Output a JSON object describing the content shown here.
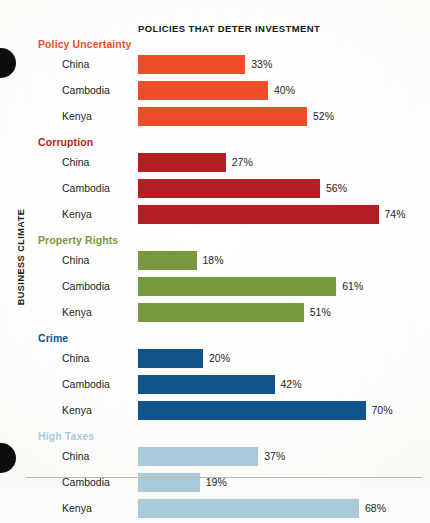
{
  "chart_title": "POLICIES THAT DETER INVESTMENT",
  "axis_label": "BUSINESS CLIMATE",
  "chart_data": {
    "type": "bar",
    "orientation": "horizontal",
    "title": "POLICIES THAT DETER INVESTMENT",
    "xlabel": "",
    "ylabel": "BUSINESS CLIMATE",
    "xlim": [
      0,
      80
    ],
    "grid": false,
    "legend": "none",
    "value_suffix": "%",
    "categories": [
      "China",
      "Cambodia",
      "Kenya"
    ],
    "groups": [
      {
        "name": "Policy Uncertainty",
        "color": "#F04E2A",
        "bars": [
          {
            "category": "China",
            "value": 33,
            "label": "33%"
          },
          {
            "category": "Cambodia",
            "value": 40,
            "label": "40%"
          },
          {
            "category": "Kenya",
            "value": 52,
            "label": "52%"
          }
        ]
      },
      {
        "name": "Corruption",
        "color": "#B51E24",
        "bars": [
          {
            "category": "China",
            "value": 27,
            "label": "27%"
          },
          {
            "category": "Cambodia",
            "value": 56,
            "label": "56%"
          },
          {
            "category": "Kenya",
            "value": 74,
            "label": "74%"
          }
        ]
      },
      {
        "name": "Property Rights",
        "color": "#79993F",
        "bars": [
          {
            "category": "China",
            "value": 18,
            "label": "18%"
          },
          {
            "category": "Cambodia",
            "value": 61,
            "label": "61%"
          },
          {
            "category": "Kenya",
            "value": 51,
            "label": "51%"
          }
        ]
      },
      {
        "name": "Crime",
        "color": "#11548C",
        "bars": [
          {
            "category": "China",
            "value": 20,
            "label": "20%"
          },
          {
            "category": "Cambodia",
            "value": 42,
            "label": "42%"
          },
          {
            "category": "Kenya",
            "value": 70,
            "label": "70%"
          }
        ]
      },
      {
        "name": "High Taxes",
        "color": "#A9CBD9",
        "bars": [
          {
            "category": "China",
            "value": 37,
            "label": "37%"
          },
          {
            "category": "Cambodia",
            "value": 19,
            "label": "19%"
          },
          {
            "category": "Kenya",
            "value": 68,
            "label": "68%"
          }
        ]
      }
    ]
  },
  "render": {
    "px_per_percent": 3.25,
    "bar_origin_x": 138
  }
}
